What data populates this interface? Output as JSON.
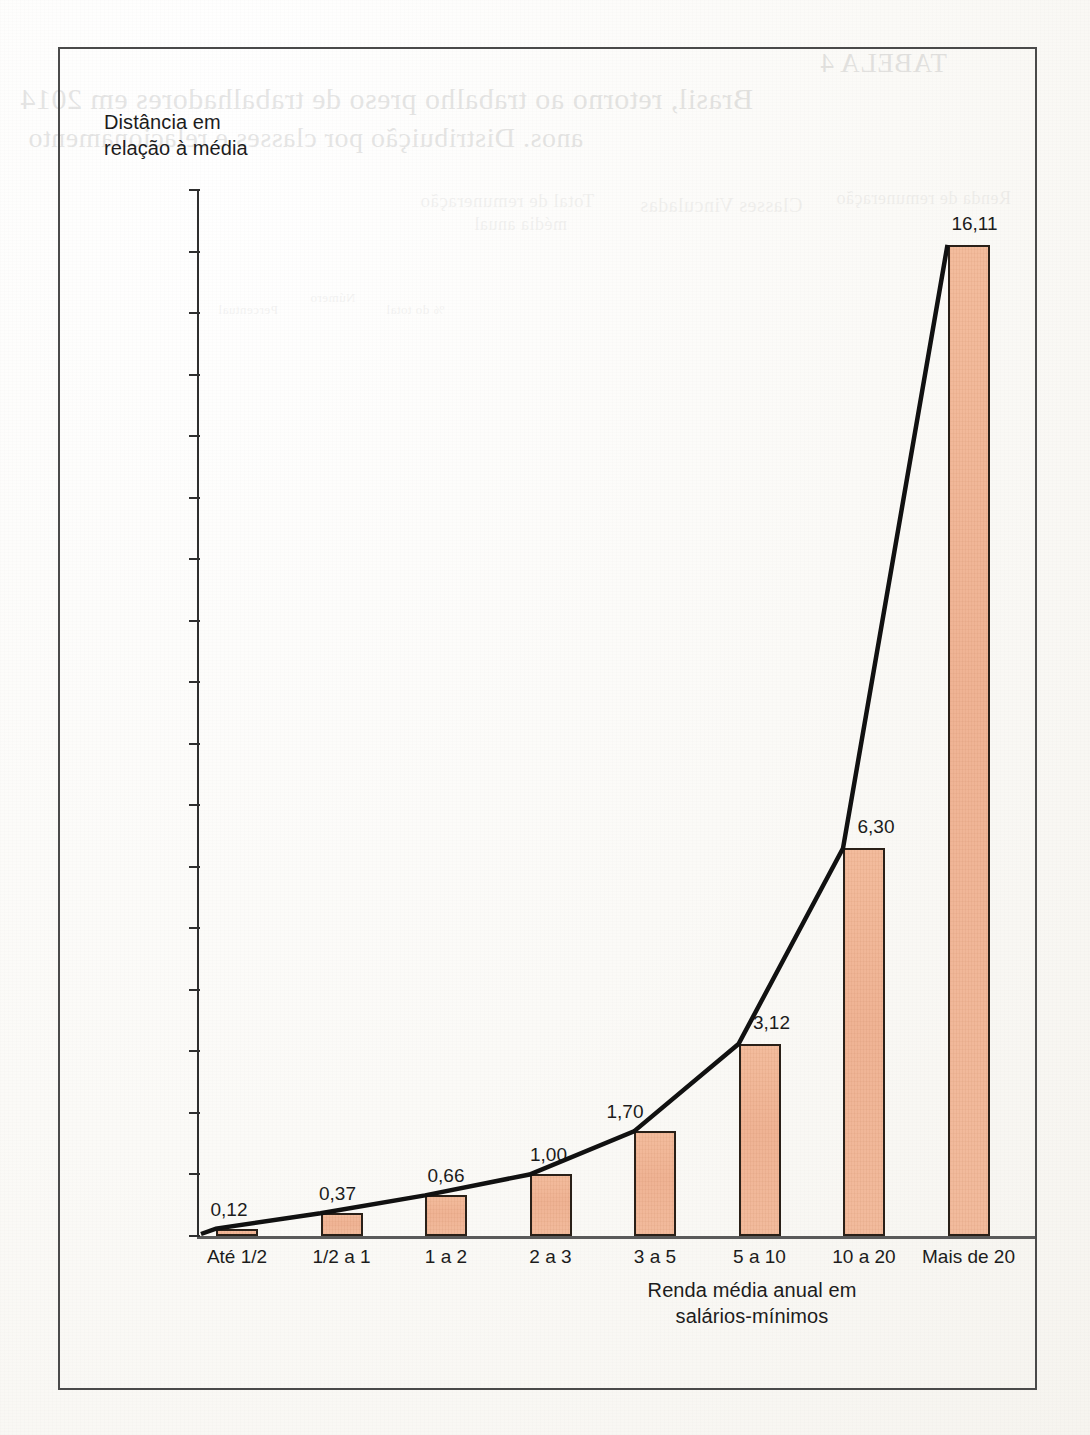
{
  "chart_data": {
    "type": "bar",
    "title": "",
    "ylabel": "Distância em relação à média",
    "ylabel_line1": "Distância em",
    "ylabel_line2": "relação à média",
    "xlabel": "Renda média anual em salários-mínimos",
    "xlabel_line1": "Renda média anual em",
    "xlabel_line2": "salários-mínimos",
    "categories": [
      "Até 1/2",
      "1/2 a 1",
      "1 a 2",
      "2 a 3",
      "3 a 5",
      "5 a 10",
      "10 a 20",
      "Mais de 20"
    ],
    "values": [
      0.12,
      0.37,
      0.66,
      1.0,
      1.7,
      3.12,
      6.3,
      16.11
    ],
    "value_labels": [
      "0,12",
      "0,37",
      "0,66",
      "1,00",
      "1,70",
      "3,12",
      "6,30",
      "16,11"
    ],
    "ylim": [
      0,
      17
    ],
    "ytick_values": [
      0,
      1,
      2,
      3,
      4,
      5,
      6,
      7,
      8,
      9,
      10,
      11,
      12,
      13,
      14,
      15,
      16,
      17
    ],
    "ytick_labels": [
      "0,0",
      "1,0",
      "2,0",
      "3,0",
      "4,0",
      "5,0",
      "6,0",
      "7,0",
      "8,0",
      "9,0",
      "10,0",
      "11,0",
      "12,0",
      "13,0",
      "14,0",
      "15,0",
      "16,0",
      "17,0"
    ],
    "grid": false,
    "legend": "none",
    "overlay_series": {
      "type": "line",
      "name": "",
      "values": [
        0.12,
        0.37,
        0.66,
        1.0,
        1.7,
        3.12,
        6.3,
        16.11
      ]
    },
    "colors": {
      "bar_fill": "#efb394",
      "bar_border": "#2a2018",
      "line": "#111111",
      "axis": "#2e2e2e",
      "text": "#1c1c1c",
      "frame": "#4a4a4a",
      "page": "#fdfcfa"
    }
  },
  "background_bleed": {
    "note": "faint mirrored show-through text from the reverse side of the scanned page",
    "items": [
      "TABELA 4",
      "Brasil, retorno ao trabalho preso de trabalhadores em 2014",
      "anos. Distribuição por classes e relacionamento",
      "Classes Vinculadas",
      "Total de remuneração",
      "Renda de remuneração",
      "média anual",
      "Número",
      "% do total",
      "Percentual"
    ]
  }
}
